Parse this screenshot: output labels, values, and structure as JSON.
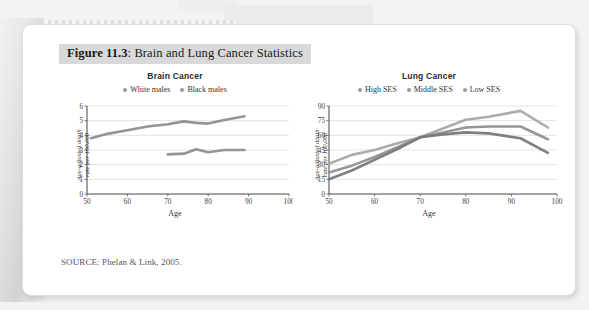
{
  "figure": {
    "caption_number": "Figure 11.3",
    "caption_sep": ": ",
    "caption_text": "Brain and Lung Cancer Statistics",
    "source": "SOURCE: Phelan & Link, 2005."
  },
  "colors": {
    "caption_band": "#d9d9d9",
    "line_dark": "#808080",
    "line_mid": "#9b9b9b",
    "line_light": "#b0b0b0",
    "grid": "#d8d8d8",
    "axis": "#555555"
  },
  "chart_data": [
    {
      "type": "line",
      "title": "Brain Cancer",
      "xlabel": "Age",
      "ylabel": "Age-adjusted death\nrate per 100,000",
      "ylabel_line1": "Age-adjusted death",
      "ylabel_line2": "rate per 100,000",
      "xlim": [
        50,
        100
      ],
      "ylim": [
        0,
        6
      ],
      "xticks": [
        50,
        60,
        70,
        80,
        90,
        100
      ],
      "yticks": [
        0,
        1,
        2,
        3,
        4,
        5,
        6
      ],
      "grid": true,
      "legend_position": "top",
      "series": [
        {
          "name": "White males",
          "color": "#8e8e8e",
          "x": [
            51,
            55,
            60,
            65,
            70,
            74,
            77,
            80,
            84,
            89
          ],
          "values": [
            3.8,
            4.1,
            4.35,
            4.6,
            4.75,
            4.95,
            4.85,
            4.8,
            5.05,
            5.3
          ]
        },
        {
          "name": "Black males",
          "color": "#8e8e8e",
          "x": [
            70,
            74,
            77,
            80,
            84,
            89
          ],
          "values": [
            2.7,
            2.75,
            3.05,
            2.85,
            3.0,
            3.0
          ]
        }
      ]
    },
    {
      "type": "line",
      "title": "Lung Cancer",
      "xlabel": "Age",
      "ylabel": "Age-adjusted death\nrate per 100,000",
      "ylabel_line1": "Age-adjusted death",
      "ylabel_line2": "rate per 100,000",
      "xlim": [
        50,
        100
      ],
      "ylim": [
        0,
        90
      ],
      "xticks": [
        50,
        60,
        70,
        80,
        90,
        100
      ],
      "yticks": [
        0,
        15,
        30,
        45,
        60,
        75,
        90
      ],
      "grid": true,
      "legend_position": "top",
      "series": [
        {
          "name": "High SES",
          "color": "#a8a8a8",
          "x": [
            50,
            55,
            60,
            65,
            70,
            75,
            80,
            85,
            92,
            98
          ],
          "values": [
            31,
            40,
            45,
            52,
            58,
            67,
            76,
            79,
            85,
            68
          ]
        },
        {
          "name": "Middle SES",
          "color": "#909090",
          "x": [
            50,
            55,
            60,
            65,
            70,
            75,
            80,
            85,
            92,
            98
          ],
          "values": [
            22,
            29,
            38,
            48,
            58,
            63,
            68,
            69,
            69,
            56
          ]
        },
        {
          "name": "Low SES",
          "color": "#787878",
          "x": [
            50,
            55,
            60,
            65,
            70,
            75,
            80,
            85,
            92,
            98
          ],
          "values": [
            15,
            24,
            35,
            46,
            58,
            61,
            63,
            62,
            57,
            42
          ]
        }
      ]
    }
  ]
}
